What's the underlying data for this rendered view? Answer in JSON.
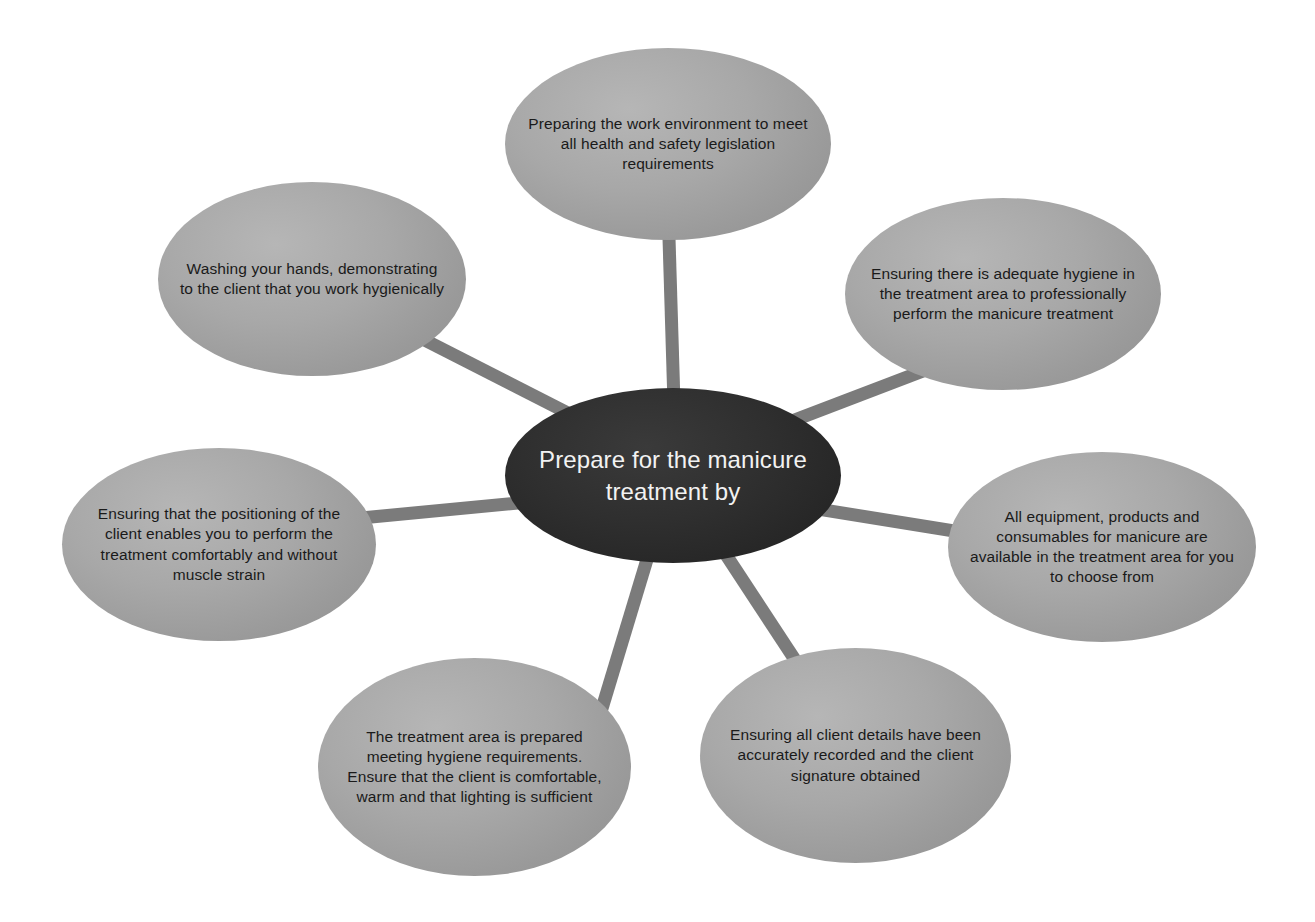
{
  "diagram": {
    "type": "hub-and-spoke radial diagram",
    "hub": {
      "id": "hub",
      "label": "Prepare for the manicure treatment by",
      "fill_color": "#2b2b2b",
      "text_color": "#f2f2f2"
    },
    "spoke_fill_color": "#a3a3a3",
    "spoke_text_color": "#1a1a1a",
    "connector_color": "#7b7b7b",
    "connector_width_px": 13,
    "background_color": "#ffffff",
    "spokes": [
      {
        "id": "top",
        "position": "top",
        "label": "Preparing the work environment to meet all health and safety legislation requirements"
      },
      {
        "id": "upper-right",
        "position": "upper-right",
        "label": "Ensuring there is adequate hygiene in the treatment area to professionally perform the manicure treatment"
      },
      {
        "id": "right",
        "position": "right",
        "label": "All equipment, products and consumables for manicure are available in the treatment area for you to choose from"
      },
      {
        "id": "lower-right",
        "position": "lower-right",
        "label": "Ensuring all client details have been accurately recorded and the client signature obtained"
      },
      {
        "id": "lower-left",
        "position": "lower-left",
        "label": "The treatment area is prepared meeting hygiene requirements. Ensure that the client is comfortable, warm and that lighting is sufficient"
      },
      {
        "id": "left",
        "position": "left",
        "label": "Ensuring that the positioning of the client enables you to perform the treatment comfortably and without muscle strain"
      },
      {
        "id": "upper-left",
        "position": "upper-left",
        "label": "Washing your hands, demonstrating to the client that you work hygienically"
      }
    ]
  }
}
